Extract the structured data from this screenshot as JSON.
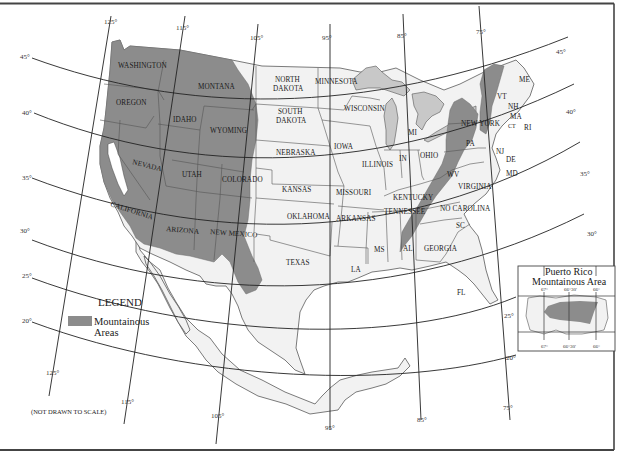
{
  "map": {
    "title": "Mountainous Areas of the United States",
    "note": "(NOT DRAWN TO SCALE)",
    "colors": {
      "mountainous": "#8c8c8c",
      "land": "#f2f2f2",
      "water": "#ffffff",
      "lakes": "#c8c8c8",
      "frame": "#555555"
    },
    "legend": {
      "title": "LEGEND",
      "items": [
        {
          "label_line1": "Mountainous",
          "label_line2": "Areas",
          "color": "#8c8c8c"
        }
      ]
    },
    "longitudes": {
      "top": [
        "125°",
        "115°",
        "105°",
        "95°",
        "85°",
        "75°"
      ],
      "bottom": [
        "125°",
        "115°",
        "105°",
        "95°",
        "85°",
        "75°"
      ]
    },
    "latitudes": {
      "left": [
        "45°",
        "40°",
        "35°",
        "30°",
        "25°",
        "20°"
      ],
      "right": [
        "45°",
        "40°",
        "35°",
        "30°",
        "25°",
        "20°"
      ]
    },
    "states": {
      "washington": "WASHINGTON",
      "oregon": "OREGON",
      "california": "CALIFORNIA",
      "nevada": "NEVADA",
      "idaho": "IDAHO",
      "montana": "MONTANA",
      "wyoming": "WYOMING",
      "utah": "UTAH",
      "colorado": "COLORADO",
      "arizona": "ARIZONA",
      "new_mexico": "NEW MEXICO",
      "north_dakota_1": "NORTH",
      "north_dakota_2": "DAKOTA",
      "south_dakota_1": "SOUTH",
      "south_dakota_2": "DAKOTA",
      "nebraska": "NEBRASKA",
      "kansas": "KANSAS",
      "oklahoma": "OKLAHOMA",
      "texas": "TEXAS",
      "minnesota": "MINNESOTA",
      "iowa": "IOWA",
      "missouri": "MISSOURI",
      "arkansas": "ARKANSAS",
      "louisiana": "LA",
      "wisconsin": "WISCONSIN",
      "illinois": "ILLINOIS",
      "michigan": "MI",
      "indiana": "IN",
      "ohio": "OHIO",
      "kentucky": "KENTUCKY",
      "tennessee": "TENNESSEE",
      "mississippi": "MS",
      "alabama": "AL",
      "georgia": "GEORGIA",
      "florida": "FL",
      "south_carolina": "SC",
      "north_carolina": "NO CAROLINA",
      "virginia": "VIRGINIA",
      "west_virginia": "WV",
      "pennsylvania": "PA",
      "new_york": "NEW YORK",
      "vermont": "VT",
      "new_hampshire": "NH",
      "maine": "ME",
      "massachusetts": "MA",
      "connecticut": "CT",
      "rhode_island": "RI",
      "new_jersey": "NJ",
      "delaware": "DE",
      "maryland": "MD"
    },
    "inset": {
      "title_line1": "Puerto Rico",
      "title_line2": "Mountainous Area",
      "top_ticks": [
        "67°",
        "66°30'",
        "66°"
      ],
      "bottom_ticks": [
        "67°",
        "66°30'",
        "66°"
      ]
    }
  }
}
